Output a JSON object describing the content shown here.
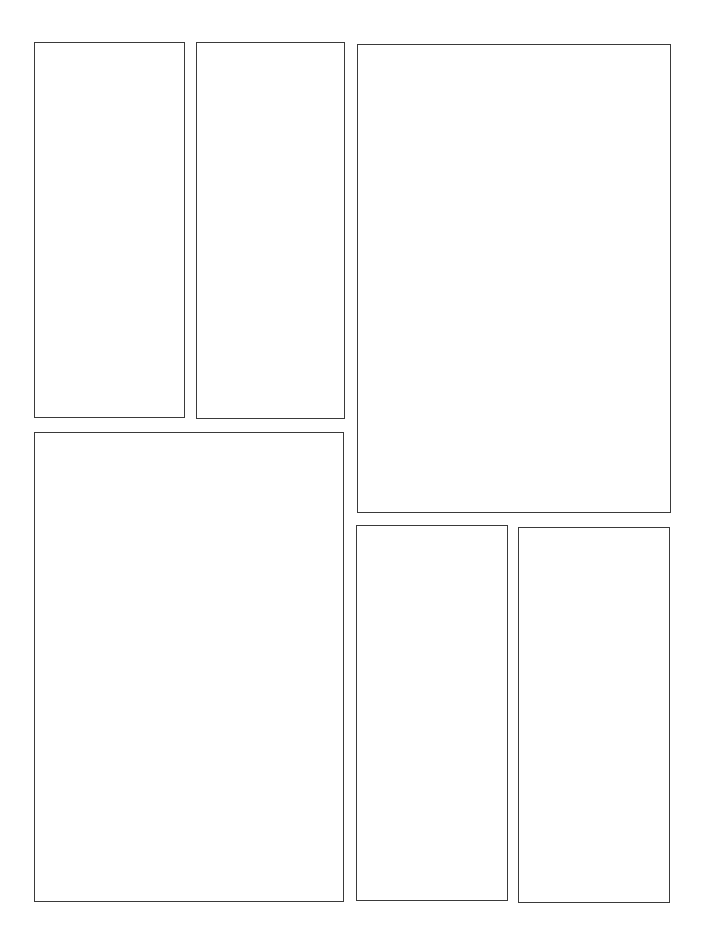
{
  "page": {
    "type": "comic-page-template",
    "background": "#ffffff",
    "border_color": "#3a3a3a",
    "panels": [
      {
        "id": "panel-1",
        "x": 34,
        "y": 42,
        "w": 151,
        "h": 376,
        "caption": ""
      },
      {
        "id": "panel-2",
        "x": 196,
        "y": 42,
        "w": 149,
        "h": 377,
        "caption": ""
      },
      {
        "id": "panel-3",
        "x": 357,
        "y": 44,
        "w": 314,
        "h": 469,
        "caption": ""
      },
      {
        "id": "panel-4",
        "x": 34,
        "y": 432,
        "w": 310,
        "h": 470,
        "caption": ""
      },
      {
        "id": "panel-5",
        "x": 356,
        "y": 525,
        "w": 152,
        "h": 376,
        "caption": ""
      },
      {
        "id": "panel-6",
        "x": 518,
        "y": 527,
        "w": 152,
        "h": 376,
        "caption": ""
      }
    ]
  }
}
